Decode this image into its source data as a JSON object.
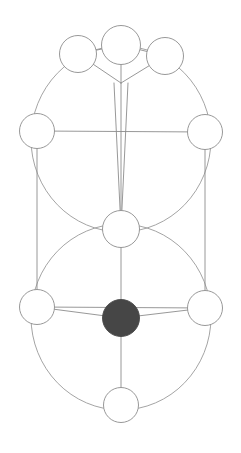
{
  "figure": {
    "type": "node-link-diagram",
    "canvas": {
      "width": 241,
      "height": 453
    },
    "background_color": "#ffffff",
    "stroke_color": "#8c8c8c",
    "arc_stroke_color": "#9a9a9a",
    "node_stroke_color": "#8c8c8c",
    "node_fill_color": "#ffffff",
    "highlight_fill_color": "#464646",
    "stroke_width": 0.9,
    "node_stroke_width": 0.9
  },
  "nodes": [
    {
      "id": "top-left",
      "label": "",
      "cx": 78,
      "cy": 54,
      "r": 18.5,
      "state": "empty"
    },
    {
      "id": "top-center",
      "label": "",
      "cx": 121,
      "cy": 45,
      "r": 19.5,
      "state": "empty"
    },
    {
      "id": "top-right",
      "label": "",
      "cx": 165,
      "cy": 56,
      "r": 18.5,
      "state": "empty"
    },
    {
      "id": "mid-left",
      "label": "",
      "cx": 37,
      "cy": 131,
      "r": 17.5,
      "state": "empty"
    },
    {
      "id": "mid-right",
      "label": "",
      "cx": 205,
      "cy": 132,
      "r": 17.5,
      "state": "empty"
    },
    {
      "id": "center",
      "label": "",
      "cx": 121,
      "cy": 229,
      "r": 18.5,
      "state": "empty"
    },
    {
      "id": "lower-left",
      "label": "",
      "cx": 37,
      "cy": 307,
      "r": 17.5,
      "state": "empty"
    },
    {
      "id": "lower-right",
      "label": "",
      "cx": 205,
      "cy": 308,
      "r": 17.5,
      "state": "empty"
    },
    {
      "id": "hub",
      "label": "",
      "cx": 121,
      "cy": 318,
      "r": 18.5,
      "state": "filled"
    },
    {
      "id": "bottom",
      "label": "",
      "cx": 121,
      "cy": 405,
      "r": 17.5,
      "state": "empty"
    }
  ],
  "arcs": [
    {
      "id": "upper-great-circle",
      "cx": 121,
      "cy": 139,
      "rx": 90,
      "ry": 93
    },
    {
      "id": "lower-great-circle",
      "cx": 121,
      "cy": 317,
      "rx": 90,
      "ry": 93
    }
  ],
  "edges": [
    {
      "id": "e-topleft-topcenter",
      "from": "top-left",
      "to": "top-center"
    },
    {
      "id": "e-topcenter-topright",
      "from": "top-center",
      "to": "top-right"
    },
    {
      "id": "e-topleft-apex",
      "from": "top-left",
      "to": "apex"
    },
    {
      "id": "e-topcenter-apex",
      "from": "top-center",
      "to": "apex"
    },
    {
      "id": "e-topright-apex",
      "from": "top-right",
      "to": "apex"
    },
    {
      "id": "e-apex-center-left",
      "from": "apex",
      "to": "center"
    },
    {
      "id": "e-apex-center-mid",
      "from": "apex",
      "to": "center"
    },
    {
      "id": "e-apex-center-right",
      "from": "apex",
      "to": "center"
    },
    {
      "id": "e-midleft-midright",
      "from": "mid-left",
      "to": "mid-right"
    },
    {
      "id": "e-midleft-lowerleft",
      "from": "mid-left",
      "to": "lower-left"
    },
    {
      "id": "e-midright-lowerright",
      "from": "mid-right",
      "to": "lower-right"
    },
    {
      "id": "e-center-hub",
      "from": "center",
      "to": "hub"
    },
    {
      "id": "e-lowerleft-hub",
      "from": "lower-left",
      "to": "hub"
    },
    {
      "id": "e-lowerright-hub",
      "from": "lower-right",
      "to": "hub"
    },
    {
      "id": "e-lowerleft-lowerright",
      "from": "lower-left",
      "to": "lower-right"
    },
    {
      "id": "e-hub-bottom",
      "from": "hub",
      "to": "bottom"
    }
  ],
  "apex": {
    "id": "apex",
    "x": 121,
    "y": 83
  }
}
